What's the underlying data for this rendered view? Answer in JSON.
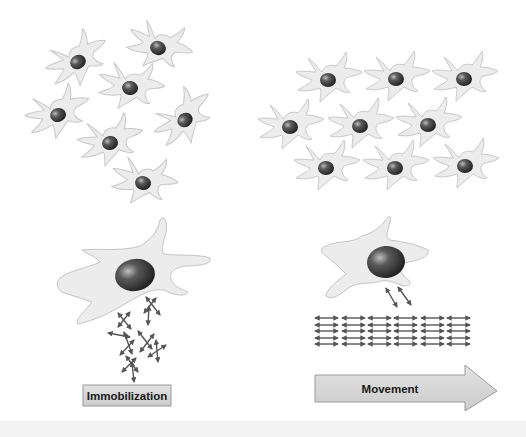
{
  "figure": {
    "left_panel": {
      "label": "Immobilization",
      "description": "Scattered, randomly oriented cells; large cell above randomly oriented fibers"
    },
    "right_panel": {
      "label": "Movement",
      "description": "Aligned cells in rows; large cell above aligned parallel fibers"
    }
  },
  "colors": {
    "cell_fill": "#ececec",
    "cell_stroke": "#c4c4c4",
    "nucleus_dark": "#2a2a2a",
    "nucleus_light": "#9a9a9a",
    "fiber": "#555555",
    "label_box": "#d4d4d4",
    "label_border": "#9a9a9a",
    "bottom_band": "#f3f3f3"
  }
}
